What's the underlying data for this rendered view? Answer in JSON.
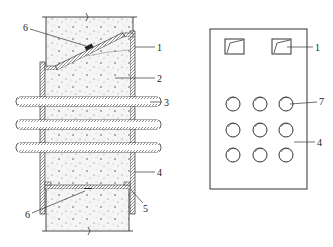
{
  "figure": {
    "left_view": {
      "description": "Section through concrete wall with embedded box and pipes",
      "labels": {
        "l1": "1",
        "l2": "2",
        "l3": "3",
        "l4": "4",
        "l5": "5",
        "l6_top": "6",
        "l6_bottom": "6"
      },
      "pipes_count": 3
    },
    "right_view": {
      "description": "Elevation of plate with two vents and 3x3 pipe openings",
      "labels": {
        "l1": "1",
        "l7": "7",
        "l4": "4"
      },
      "vents_count": 2,
      "holes_rows": 3,
      "holes_cols": 3
    },
    "colors": {
      "line": "#333333",
      "fill_concrete": "#f4f4f4",
      "dots": "#555555",
      "background": "#ffffff"
    }
  }
}
